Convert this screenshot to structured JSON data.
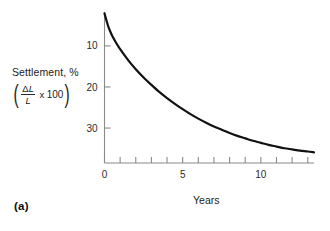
{
  "panel": {
    "label": "(a)"
  },
  "axis_caption": {
    "line1": "Settlement, %",
    "formula": {
      "open_paren": "(",
      "numerator_delta": "Δ",
      "numerator_l": "L",
      "denominator": "L",
      "times": "x",
      "factor": "100",
      "close_paren": ")"
    }
  },
  "chart_data": {
    "type": "line",
    "title": "",
    "subtitle": "",
    "xlabel": "Years",
    "ylabel": "Settlement, %",
    "ylabel_formula": "(ΔL/L x 100)",
    "x_ticks": [
      0,
      1,
      2,
      3,
      4,
      5,
      6,
      7,
      8,
      9,
      10,
      11,
      12,
      13
    ],
    "x_tick_labels": [
      "0",
      "",
      "",
      "",
      "",
      "5",
      "",
      "",
      "",
      "",
      "10",
      "",
      "",
      ""
    ],
    "xlim": [
      0,
      13.4
    ],
    "y_ticks": [
      10,
      20,
      30
    ],
    "y_tick_labels": [
      "10",
      "20",
      "30"
    ],
    "ylim": [
      2.0,
      38.5
    ],
    "y_axis_inverted": true,
    "grid": false,
    "legend": null,
    "line_color": "#111111",
    "line_width_px": 2.2,
    "axis_color": "#8a8a8a",
    "background_color": "#ffffff",
    "series": [
      {
        "name": "Settlement",
        "x": [
          0.0,
          0.25,
          0.5,
          0.75,
          1.0,
          1.5,
          2.0,
          2.5,
          3.0,
          3.5,
          4.0,
          4.5,
          5.0,
          5.5,
          6.0,
          6.5,
          7.0,
          7.5,
          8.0,
          8.5,
          9.0,
          9.5,
          10.0,
          10.5,
          11.0,
          11.5,
          12.0,
          12.5,
          13.0,
          13.4
        ],
        "y": [
          2.1,
          5.4,
          7.6,
          9.3,
          10.8,
          13.4,
          15.7,
          17.7,
          19.5,
          21.2,
          22.7,
          24.1,
          25.4,
          26.6,
          27.7,
          28.7,
          29.6,
          30.4,
          31.2,
          31.9,
          32.5,
          33.1,
          33.6,
          34.1,
          34.5,
          34.9,
          35.2,
          35.5,
          35.7,
          35.9
        ]
      }
    ]
  }
}
